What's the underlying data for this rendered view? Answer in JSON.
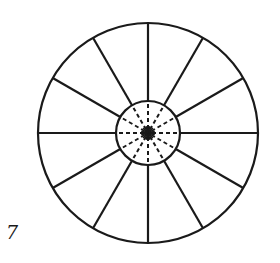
{
  "figure": {
    "label": "7",
    "stroke_color": "#1a1a1a",
    "background": "#ffffff",
    "center": [
      148,
      133
    ],
    "outer_radius": 110,
    "inner_radius": 32,
    "spoke_count": 12,
    "outer_spokes_style": "solid",
    "inner_spokes_style": "dashed",
    "center_mark": "star-burst"
  }
}
